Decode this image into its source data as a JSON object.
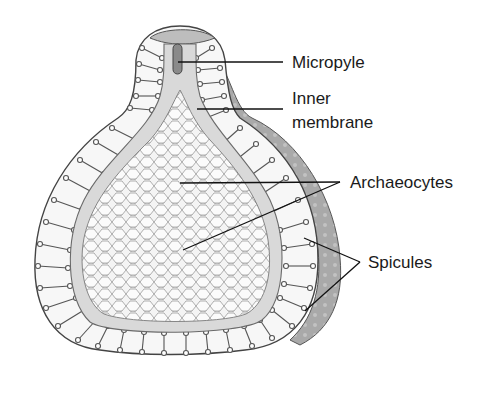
{
  "diagram": {
    "labels": {
      "micropyle": "Micropyle",
      "inner_membrane_line1": "Inner",
      "inner_membrane_line2": "membrane",
      "archaeocytes": "Archaeocytes",
      "spicules": "Spicules"
    },
    "colors": {
      "background": "#ffffff",
      "outline": "#3a3a3a",
      "membrane_fill": "#d9d9d9",
      "outer_coat_shadow": "#a8a8a8",
      "cell_fill": "#f4f4f4",
      "leader_line": "#111111"
    }
  }
}
